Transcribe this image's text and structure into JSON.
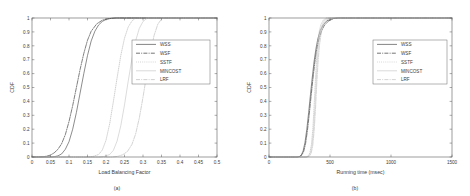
{
  "figure": {
    "background": "#ffffff",
    "panels": [
      {
        "id": "a",
        "caption": "(a)",
        "xlabel": "Load Balancing Factor",
        "ylabel": "CDF"
      },
      {
        "id": "b",
        "caption": "(b)",
        "xlabel": "Running time (msec)",
        "ylabel": "CDF"
      }
    ]
  },
  "chart_data": [
    {
      "type": "line",
      "panel": "a",
      "title": "",
      "caption": "(a)",
      "xlabel": "Load Balancing Factor",
      "ylabel": "CDF",
      "xlim": [
        0,
        0.5
      ],
      "ylim": [
        0,
        1
      ],
      "xticks": [
        0,
        0.05,
        0.1,
        0.15,
        0.2,
        0.25,
        0.3,
        0.35,
        0.4,
        0.45,
        0.5
      ],
      "xticklabels": [
        "0",
        "0.05",
        "0.1",
        "0.15",
        "0.2",
        "0.25",
        "0.3",
        "0.35",
        "0.4",
        "0.45",
        "0.5"
      ],
      "yticks": [
        0,
        0.1,
        0.2,
        0.3,
        0.4,
        0.5,
        0.6,
        0.7,
        0.8,
        0.9,
        1
      ],
      "yticklabels": [
        "0",
        "0.1",
        "0.2",
        "0.3",
        "0.4",
        "0.5",
        "0.6",
        "0.7",
        "0.8",
        "0.9",
        "1"
      ],
      "grid": false,
      "legend_position": "center-right",
      "series": [
        {
          "name": "WSS",
          "style": "solid",
          "color": "#4f4f4f",
          "x": [
            0.0,
            0.05,
            0.06,
            0.07,
            0.08,
            0.09,
            0.1,
            0.11,
            0.12,
            0.13,
            0.14,
            0.15,
            0.16,
            0.17,
            0.18,
            0.19,
            0.2,
            0.215,
            0.23,
            0.5
          ],
          "y": [
            0.0,
            0.0,
            0.002,
            0.008,
            0.022,
            0.055,
            0.11,
            0.2,
            0.32,
            0.46,
            0.6,
            0.73,
            0.835,
            0.905,
            0.95,
            0.975,
            0.99,
            0.998,
            1.0,
            1.0
          ]
        },
        {
          "name": "WSF",
          "style": "dashdot",
          "color": "#3a3a3a",
          "x": [
            0.0,
            0.03,
            0.04,
            0.05,
            0.06,
            0.07,
            0.08,
            0.09,
            0.1,
            0.11,
            0.12,
            0.13,
            0.14,
            0.15,
            0.16,
            0.175,
            0.19,
            0.205,
            0.225,
            0.5
          ],
          "y": [
            0.0,
            0.002,
            0.006,
            0.014,
            0.03,
            0.055,
            0.095,
            0.16,
            0.255,
            0.37,
            0.5,
            0.63,
            0.745,
            0.84,
            0.905,
            0.958,
            0.984,
            0.995,
            1.0,
            1.0
          ]
        },
        {
          "name": "SSTF",
          "style": "dotted",
          "color": "#b6b6b6",
          "x": [
            0.0,
            0.15,
            0.165,
            0.18,
            0.19,
            0.2,
            0.21,
            0.22,
            0.23,
            0.24,
            0.25,
            0.26,
            0.27,
            0.28,
            0.5
          ],
          "y": [
            0.0,
            0.0,
            0.004,
            0.018,
            0.05,
            0.12,
            0.24,
            0.4,
            0.57,
            0.73,
            0.855,
            0.935,
            0.978,
            1.0,
            1.0
          ]
        },
        {
          "name": "MINCOST",
          "style": "solid-light",
          "color": "#c9c9c9",
          "x": [
            0.0,
            0.18,
            0.195,
            0.21,
            0.22,
            0.23,
            0.24,
            0.25,
            0.26,
            0.27,
            0.28,
            0.29,
            0.3,
            0.312,
            0.5
          ],
          "y": [
            0.0,
            0.0,
            0.004,
            0.018,
            0.048,
            0.115,
            0.225,
            0.375,
            0.545,
            0.705,
            0.835,
            0.925,
            0.975,
            1.0,
            1.0
          ]
        },
        {
          "name": "LRF",
          "style": "dashdot-light",
          "color": "#bdbdbd",
          "x": [
            0.0,
            0.215,
            0.23,
            0.245,
            0.258,
            0.27,
            0.28,
            0.29,
            0.3,
            0.31,
            0.32,
            0.33,
            0.34,
            0.352,
            0.5
          ],
          "y": [
            0.0,
            0.0,
            0.004,
            0.016,
            0.04,
            0.09,
            0.165,
            0.28,
            0.43,
            0.595,
            0.75,
            0.875,
            0.955,
            1.0,
            1.0
          ]
        }
      ]
    },
    {
      "type": "line",
      "panel": "b",
      "title": "",
      "caption": "(b)",
      "xlabel": "Running time (msec)",
      "ylabel": "CDF",
      "xlim": [
        0,
        1500
      ],
      "ylim": [
        0,
        1
      ],
      "xticks": [
        0,
        500,
        1000,
        1500
      ],
      "xticklabels": [
        "0",
        "500",
        "1000",
        "1500"
      ],
      "yticks": [
        0,
        0.1,
        0.2,
        0.3,
        0.4,
        0.5,
        0.6,
        0.7,
        0.8,
        0.9,
        1
      ],
      "yticklabels": [
        "0",
        "0.1",
        "0.2",
        "0.3",
        "0.4",
        "0.5",
        "0.6",
        "0.7",
        "0.8",
        "0.9",
        "1"
      ],
      "grid": false,
      "legend_position": "center-right",
      "series": [
        {
          "name": "WSS",
          "style": "solid",
          "color": "#4f4f4f",
          "x": [
            0,
            230,
            250,
            265,
            280,
            295,
            310,
            325,
            340,
            355,
            370,
            385,
            400,
            420,
            445,
            475,
            520,
            560,
            1500
          ],
          "y": [
            0,
            0.0,
            0.004,
            0.015,
            0.045,
            0.105,
            0.2,
            0.32,
            0.45,
            0.575,
            0.69,
            0.78,
            0.85,
            0.91,
            0.952,
            0.98,
            0.996,
            1.0,
            1.0
          ]
        },
        {
          "name": "WSF",
          "style": "dashdot",
          "color": "#3a3a3a",
          "x": [
            0,
            235,
            255,
            270,
            285,
            300,
            315,
            330,
            345,
            360,
            375,
            390,
            408,
            430,
            455,
            490,
            530,
            570,
            1500
          ],
          "y": [
            0,
            0.0,
            0.004,
            0.014,
            0.042,
            0.098,
            0.19,
            0.308,
            0.438,
            0.562,
            0.678,
            0.77,
            0.845,
            0.906,
            0.95,
            0.979,
            0.996,
            1.0,
            1.0
          ]
        },
        {
          "name": "SSTF",
          "style": "dotted",
          "color": "#bcbcbc",
          "x": [
            0,
            300,
            320,
            335,
            348,
            360,
            370,
            380,
            390,
            400,
            412,
            425,
            445,
            470,
            1500
          ],
          "y": [
            0,
            0.0,
            0.006,
            0.03,
            0.09,
            0.21,
            0.37,
            0.545,
            0.705,
            0.825,
            0.905,
            0.952,
            0.985,
            1.0,
            1.0
          ]
        },
        {
          "name": "MINCOST",
          "style": "solid-light",
          "color": "#cccccc",
          "x": [
            0,
            305,
            325,
            340,
            353,
            365,
            376,
            386,
            396,
            407,
            420,
            434,
            455,
            482,
            1500
          ],
          "y": [
            0,
            0.0,
            0.006,
            0.028,
            0.085,
            0.2,
            0.355,
            0.53,
            0.692,
            0.815,
            0.898,
            0.948,
            0.983,
            1.0,
            1.0
          ]
        },
        {
          "name": "LRF",
          "style": "dashdot-light",
          "color": "#c2c2c2",
          "x": [
            0,
            310,
            330,
            345,
            358,
            370,
            381,
            391,
            402,
            414,
            428,
            443,
            466,
            495,
            1500
          ],
          "y": [
            0,
            0.0,
            0.005,
            0.025,
            0.078,
            0.188,
            0.34,
            0.515,
            0.68,
            0.806,
            0.892,
            0.944,
            0.981,
            1.0,
            1.0
          ]
        }
      ]
    }
  ],
  "legend": {
    "entries": [
      "WSS",
      "WSF",
      "SSTF",
      "MINCOST",
      "LRF"
    ]
  }
}
